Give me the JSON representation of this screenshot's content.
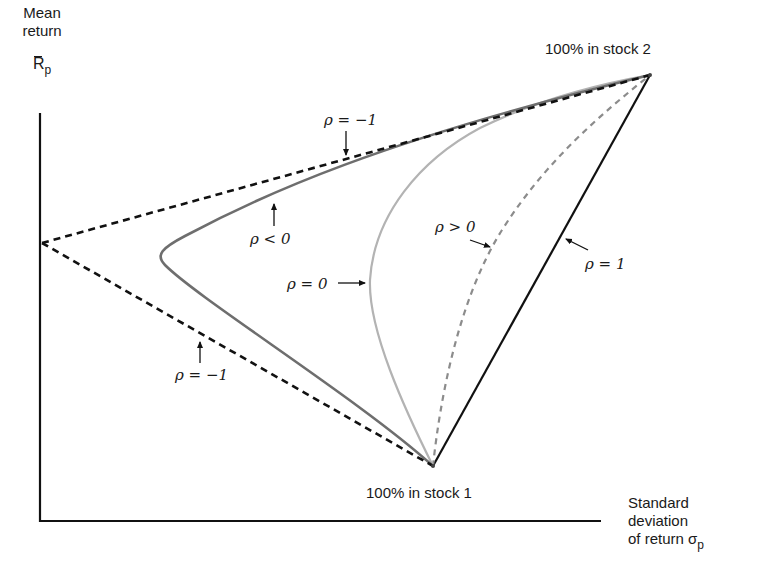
{
  "diagram": {
    "y_axis": {
      "label_line1": "Mean",
      "label_line2": "return",
      "symbol_main": "R",
      "symbol_sub": "p"
    },
    "x_axis": {
      "label_line1": "Standard",
      "label_line2": "deviation",
      "label_line3": "of return σ",
      "symbol_sub": "p"
    },
    "points": {
      "stock2": {
        "label": "100% in stock 2"
      },
      "stock1": {
        "label": "100% in stock 1"
      }
    },
    "curve_labels": {
      "rho_neg1_top": "ρ = −1",
      "rho_neg": "ρ < 0",
      "rho_zero": "ρ = 0",
      "rho_pos": "ρ > 0",
      "rho_one": "ρ = 1",
      "rho_neg1_bottom": "ρ = −1"
    },
    "colors": {
      "axis": "#111111",
      "rho_neg1": "#111111",
      "rho_neg": "#6e6e6e",
      "rho_zero": "#b3b3b3",
      "rho_pos": "#8c8c8c",
      "rho_one": "#111111",
      "text": "#1a1a1a"
    }
  }
}
